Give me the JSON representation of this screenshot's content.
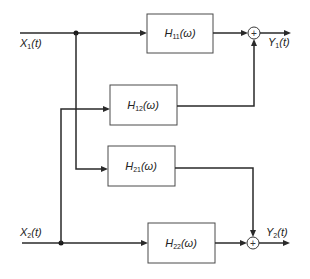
{
  "diagram": {
    "type": "block-diagram",
    "inputs": [
      {
        "id": "x1",
        "label": "X",
        "subscript": "1",
        "arg": "(t)"
      },
      {
        "id": "x2",
        "label": "X",
        "subscript": "2",
        "arg": "(t)"
      }
    ],
    "outputs": [
      {
        "id": "y1",
        "label": "Y",
        "subscript": "1",
        "arg": "(t)"
      },
      {
        "id": "y2",
        "label": "Y",
        "subscript": "2",
        "arg": "(t)"
      }
    ],
    "blocks": [
      {
        "id": "h11",
        "label": "H",
        "subscript": "11",
        "arg": "(ω)",
        "from": "x1",
        "to": "sum1"
      },
      {
        "id": "h12",
        "label": "H",
        "subscript": "12",
        "arg": "(ω)",
        "from": "x2",
        "to": "sum1"
      },
      {
        "id": "h21",
        "label": "H",
        "subscript": "21",
        "arg": "(ω)",
        "from": "x1",
        "to": "sum2"
      },
      {
        "id": "h22",
        "label": "H",
        "subscript": "22",
        "arg": "(ω)",
        "from": "x2",
        "to": "sum2"
      }
    ],
    "summers": [
      {
        "id": "sum1",
        "symbol": "+",
        "output": "y1"
      },
      {
        "id": "sum2",
        "symbol": "+",
        "output": "y2"
      }
    ],
    "colors": {
      "line": "#2a2a2a",
      "box_border": "#4a4a4a",
      "background": "#ffffff"
    }
  }
}
